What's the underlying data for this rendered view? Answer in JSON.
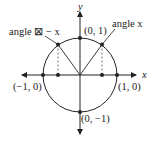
{
  "diagram": {
    "axes": {
      "x_label": "x",
      "y_label": "y"
    },
    "points": [
      {
        "label": "(0, 1)"
      },
      {
        "label": "(1, 0)"
      },
      {
        "label": "(−1, 0)"
      },
      {
        "label": "(0, −1)"
      }
    ],
    "angle_labels": {
      "right": "angle x",
      "left": "angle ⊠ − x"
    },
    "colors": {
      "stroke": "#222222",
      "dashed": "#555555",
      "background": "#ffffff"
    }
  }
}
